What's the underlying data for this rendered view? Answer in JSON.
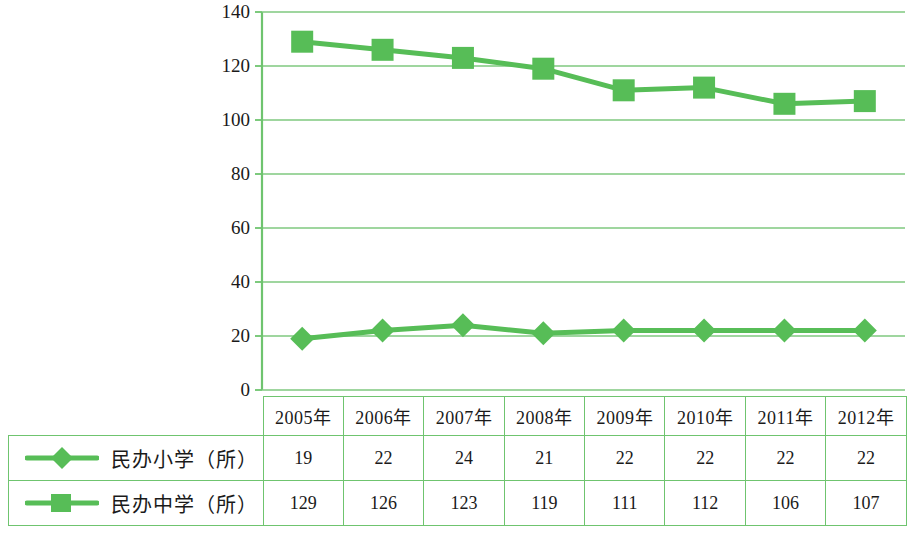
{
  "chart_data": {
    "type": "line",
    "title": "",
    "xlabel": "",
    "ylabel": "",
    "categories": [
      "2005年",
      "2006年",
      "2007年",
      "2008年",
      "2009年",
      "2010年",
      "2011年",
      "2012年"
    ],
    "series": [
      {
        "name": "民办小学（所）",
        "marker": "diamond",
        "color": "#57bd57",
        "values": [
          19,
          22,
          24,
          21,
          22,
          22,
          22,
          22
        ]
      },
      {
        "name": "民办中学（所）",
        "marker": "square",
        "color": "#57bd57",
        "values": [
          129,
          126,
          123,
          119,
          111,
          112,
          106,
          107
        ]
      }
    ],
    "ylim": [
      0,
      140
    ],
    "ytick_step": 20,
    "yticks": [
      "0",
      "20",
      "40",
      "60",
      "80",
      "100",
      "120",
      "140"
    ],
    "grid": true,
    "legend_position": "table-left-column"
  },
  "colors": {
    "series_green": "#57bd57",
    "grid_green": "#7fc97f",
    "axis_green": "#6fc46f",
    "table_border": "#6fc46f",
    "background": "#ffffff",
    "text": "#1a1a1a"
  },
  "table": {
    "header_blank": "",
    "headers": [
      "2005年",
      "2006年",
      "2007年",
      "2008年",
      "2009年",
      "2010年",
      "2011年",
      "2012年"
    ],
    "rows": [
      {
        "label": "民办小学（所）",
        "marker": "diamond-line-marker",
        "values": [
          "19",
          "22",
          "24",
          "21",
          "22",
          "22",
          "22",
          "22"
        ]
      },
      {
        "label": "民办中学（所）",
        "marker": "square-line-marker",
        "values": [
          "129",
          "126",
          "123",
          "119",
          "111",
          "112",
          "106",
          "107"
        ]
      }
    ]
  }
}
